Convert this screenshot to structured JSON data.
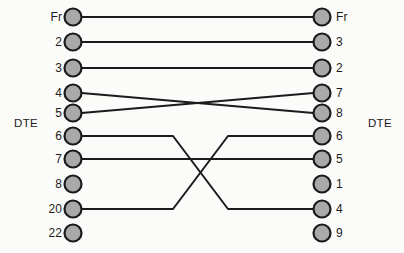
{
  "diagram": {
    "background_color": "#fbfbfa",
    "connector_fill": "#a9a9a9",
    "connector_stroke": "#1b1b1b",
    "wire_color": "#1b1b1b",
    "left_side_label": "DTE",
    "right_side_label": "DTE",
    "left_column_x": 73,
    "right_column_x": 322,
    "connector_radius": 8.5,
    "connector_stroke_width": 2.2,
    "wire_width": 2.0,
    "left_pins": [
      {
        "label": "Fr",
        "y": 17,
        "connected": true
      },
      {
        "label": "2",
        "y": 42,
        "connected": true
      },
      {
        "label": "3",
        "y": 68,
        "connected": true
      },
      {
        "label": "4",
        "y": 93,
        "connected": true
      },
      {
        "label": "5",
        "y": 113,
        "connected": true
      },
      {
        "label": "6",
        "y": 136,
        "connected": true
      },
      {
        "label": "7",
        "y": 159,
        "connected": true
      },
      {
        "label": "8",
        "y": 184,
        "connected": false
      },
      {
        "label": "20",
        "y": 209,
        "connected": true
      },
      {
        "label": "22",
        "y": 233,
        "connected": false
      }
    ],
    "right_pins": [
      {
        "label": "Fr",
        "y": 17,
        "connected": true
      },
      {
        "label": "3",
        "y": 42,
        "connected": true
      },
      {
        "label": "2",
        "y": 68,
        "connected": true
      },
      {
        "label": "7",
        "y": 93,
        "connected": true
      },
      {
        "label": "8",
        "y": 113,
        "connected": true
      },
      {
        "label": "6",
        "y": 136,
        "connected": true
      },
      {
        "label": "5",
        "y": 159,
        "connected": true
      },
      {
        "label": "1",
        "y": 184,
        "connected": false
      },
      {
        "label": "4",
        "y": 209,
        "connected": true
      },
      {
        "label": "9",
        "y": 233,
        "connected": false
      }
    ],
    "side_label_y": 124,
    "left_side_label_x": 38,
    "right_side_label_x": 368,
    "left_pin_label_x": 62,
    "right_pin_label_x": 336,
    "connections": [
      {
        "from": "Fr",
        "to": "Fr",
        "from_y": 17,
        "to_y": 17,
        "style": "straight"
      },
      {
        "from": "2",
        "to": "3",
        "from_y": 42,
        "to_y": 42,
        "style": "diagonal"
      },
      {
        "from": "3",
        "to": "2",
        "from_y": 68,
        "to_y": 68,
        "style": "diagonal"
      },
      {
        "from": "4",
        "to": "8",
        "from_y": 93,
        "to_y": 113,
        "style": "diagonal"
      },
      {
        "from": "5",
        "to": "7",
        "from_y": 113,
        "to_y": 93,
        "style": "diagonal"
      },
      {
        "from": "6",
        "to": "4",
        "from_y": 136,
        "to_y": 209,
        "style": "orthogonal"
      },
      {
        "from": "7",
        "to": "5",
        "from_y": 159,
        "to_y": 159,
        "style": "straight"
      },
      {
        "from": "20",
        "to": "6",
        "from_y": 209,
        "to_y": 136,
        "style": "orthogonal"
      }
    ],
    "bend_left_x": 173,
    "bend_right_x": 228
  }
}
